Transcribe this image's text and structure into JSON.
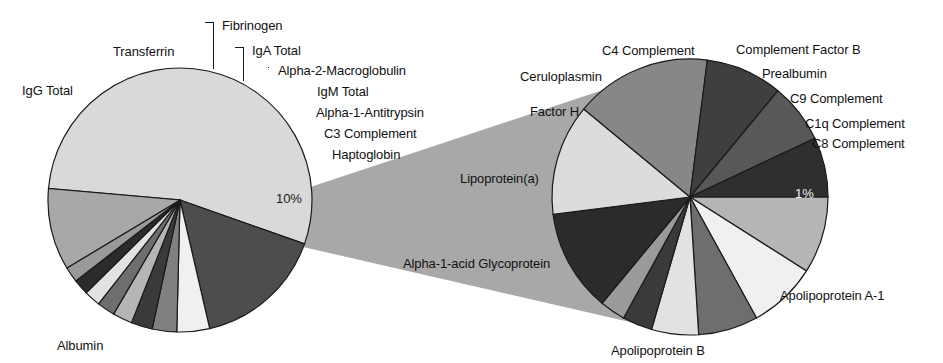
{
  "figure": {
    "title": "",
    "type": "pie-of-pie",
    "width": 943,
    "height": 363
  },
  "chart_data": {
    "type": "pie",
    "title": "",
    "subtitle": "",
    "xlabel": "",
    "ylabel": "",
    "legend_position": "none",
    "grid": false,
    "charts": [
      {
        "name": "main-pie",
        "center": [
          180,
          200
        ],
        "radius": 132,
        "start_angle_deg": 185,
        "direction": "clockwise",
        "data_labels": [
          "10%"
        ],
        "categories": [
          "Albumin",
          "IgG Total",
          "Transferrin",
          "Fibrinogen",
          "IgA Total",
          "Alpha-2-Macroglobulin",
          "IgM Total",
          "Alpha-1-Antitrypsin",
          "C3 Complement",
          "Haptoglobin",
          "Other (10%)"
        ],
        "values": [
          54,
          16,
          4,
          3,
          2.6,
          2.4,
          2.2,
          2.0,
          1.9,
          1.9,
          10
        ],
        "colors": [
          "#d9d9d9",
          "#4d4d4d",
          "#f0f0f0",
          "#808080",
          "#3a3a3a",
          "#b5b5b5",
          "#6e6e6e",
          "#e2e2e2",
          "#2b2b2b",
          "#9a9a9a",
          "#a8a8a8"
        ]
      },
      {
        "name": "detail-pie",
        "center": [
          690,
          197
        ],
        "radius": 138,
        "start_angle_deg": 0,
        "direction": "clockwise",
        "data_labels": [
          "1%"
        ],
        "represents": "Other (10%) slice of main pie",
        "categories": [
          "C4 Complement",
          "Complement Factor B",
          "Prealbumin",
          "C9 Complement",
          "C1q Complement",
          "C8 Complement",
          "Apolipoprotein A-1",
          "Apolipoprotein B",
          "Alpha-1-acid Glycoprotein",
          "Lipoprotein(a)",
          "Factor H",
          "Ceruloplasmin"
        ],
        "values": [
          9,
          8,
          7,
          5.5,
          3.5,
          3,
          12,
          13,
          16,
          9,
          7,
          7
        ],
        "colors": [
          "#b5b5b5",
          "#f0f0f0",
          "#6e6e6e",
          "#e2e2e2",
          "#3a3a3a",
          "#9a9a9a",
          "#2b2b2b",
          "#dcdcdc",
          "#878787",
          "#3f3f3f",
          "#585858",
          "#2f2f2f"
        ]
      }
    ],
    "connector": {
      "color": "#a8a8a8",
      "from": "main-pie Other slice",
      "to": "detail-pie"
    }
  },
  "labels": {
    "main": [
      {
        "id": "igg-total",
        "text": "IgG Total",
        "x": 22,
        "y": 84
      },
      {
        "id": "transferrin",
        "text": "Transferrin",
        "x": 113,
        "y": 45
      },
      {
        "id": "fibrinogen",
        "text": "Fibrinogen",
        "x": 222,
        "y": 19
      },
      {
        "id": "iga-total",
        "text": "IgA Total",
        "x": 252,
        "y": 44
      },
      {
        "id": "alpha-2-macroglobulin",
        "text": "Alpha-2-Macroglobulin",
        "x": 278,
        "y": 64
      },
      {
        "id": "igm-total",
        "text": "IgM Total",
        "x": 317,
        "y": 85
      },
      {
        "id": "alpha-1-antitrypsin",
        "text": "Alpha-1-Antitrypsin",
        "x": 316,
        "y": 106
      },
      {
        "id": "c3-complement",
        "text": "C3 Complement",
        "x": 324,
        "y": 127
      },
      {
        "id": "haptoglobin",
        "text": "Haptoglobin",
        "x": 332,
        "y": 148
      },
      {
        "id": "albumin",
        "text": "Albumin",
        "x": 57,
        "y": 339
      },
      {
        "id": "main-pct",
        "text": "10%",
        "x": 276,
        "y": 192
      }
    ],
    "detail": [
      {
        "id": "c4-complement",
        "text": "C4 Complement",
        "x": 602,
        "y": 44
      },
      {
        "id": "complement-factor-b",
        "text": "Complement Factor B",
        "x": 736,
        "y": 43
      },
      {
        "id": "prealbumin",
        "text": "Prealbumin",
        "x": 762,
        "y": 67
      },
      {
        "id": "c9-complement",
        "text": "C9 Complement",
        "x": 790,
        "y": 92
      },
      {
        "id": "c1q-complement",
        "text": "C1q Complement",
        "x": 805,
        "y": 117
      },
      {
        "id": "c8-complement",
        "text": "C8 Complement",
        "x": 812,
        "y": 137
      },
      {
        "id": "ceruloplasmin",
        "text": "Ceruloplasmin",
        "x": 520,
        "y": 70
      },
      {
        "id": "factor-h",
        "text": "Factor H",
        "x": 530,
        "y": 105
      },
      {
        "id": "lipoprotein-a",
        "text": "Lipoprotein(a)",
        "x": 460,
        "y": 172
      },
      {
        "id": "alpha-1-acid-glycoprotein",
        "text": "Alpha-1-acid Glycoprotein",
        "x": 403,
        "y": 257
      },
      {
        "id": "apolipoprotein-b",
        "text": "Apolipoprotein B",
        "x": 611,
        "y": 344
      },
      {
        "id": "apolipoprotein-a1",
        "text": "Apolipoprotein A-1",
        "x": 780,
        "y": 289
      },
      {
        "id": "detail-pct",
        "text": "1%",
        "x": 795,
        "y": 187
      }
    ]
  }
}
